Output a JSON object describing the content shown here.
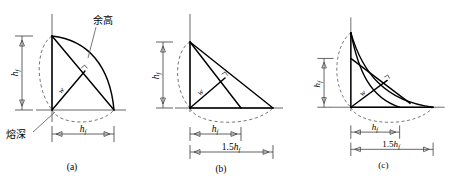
{
  "figure": {
    "panels": [
      {
        "id": "a",
        "caption": "(a)",
        "labels": {
          "height": "h",
          "height_sub": "f",
          "width_bottom": "h",
          "width_bottom_sub": "f",
          "throat": "w",
          "reinforcement_cn": "余高",
          "penetration_cn": "熔深"
        },
        "shape": "circular-arc convex bead with equal height and width",
        "curve_type": "convex-arc",
        "dim_vertical": "h_f",
        "dim_horizontal": "h_f"
      },
      {
        "id": "b",
        "caption": "(b)",
        "labels": {
          "height": "h",
          "height_sub": "f",
          "width_inner": "h",
          "width_inner_sub": "f",
          "width_outer_num": "1.5",
          "width_outer": "h",
          "width_outer_sub": "f",
          "throat": "w"
        },
        "shape": "straight-sided triangular bead, flat face",
        "curve_type": "straight",
        "dim_vertical": "h_f",
        "dim_horizontal_inner": "h_f",
        "dim_horizontal_outer": "1.5h_f"
      },
      {
        "id": "c",
        "caption": "(c)",
        "labels": {
          "height": "h",
          "height_sub": "f",
          "width_inner": "h",
          "width_inner_sub": "f",
          "width_outer_num": "1.5",
          "width_outer": "h",
          "width_outer_sub": "f",
          "throat": "w"
        },
        "shape": "concave bead with hollow fillet face",
        "curve_type": "concave-arc",
        "dim_vertical": "h_f",
        "dim_horizontal_inner": "h_f",
        "dim_horizontal_outer": "1.5h_f"
      }
    ],
    "colors": {
      "stroke": "#000000",
      "axis": "#555555",
      "dashed": "#666666",
      "background": "#ffffff"
    }
  }
}
